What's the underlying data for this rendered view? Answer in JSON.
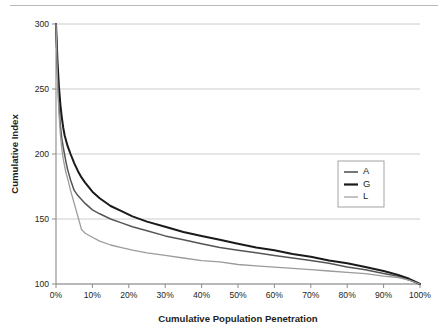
{
  "figure": {
    "has_top_rule": true
  },
  "chart_data": {
    "type": "line",
    "title": "",
    "xlabel": "Cumulative Population Penetration",
    "ylabel": "Cumulative Index",
    "xlim": [
      0,
      100
    ],
    "ylim": [
      100,
      300
    ],
    "grid": true,
    "grid_axis": "y",
    "legend_position": "right-middle",
    "x_ticks": [
      0,
      10,
      20,
      30,
      40,
      50,
      60,
      70,
      80,
      90,
      100
    ],
    "x_tick_labels": [
      "0%",
      "10%",
      "20%",
      "30%",
      "40%",
      "50%",
      "60%",
      "70%",
      "80%",
      "90%",
      "100%"
    ],
    "y_ticks": [
      100,
      150,
      200,
      250,
      300
    ],
    "y_tick_labels": [
      "100",
      "150",
      "200",
      "250",
      "300"
    ],
    "x": [
      0,
      0.4,
      0.8,
      1.2,
      1.6,
      2,
      2.4,
      2.8,
      3.2,
      4,
      5,
      6,
      7,
      8,
      10,
      12,
      15,
      18,
      21,
      25,
      30,
      35,
      40,
      45,
      50,
      55,
      60,
      65,
      70,
      75,
      80,
      85,
      90,
      94,
      97,
      100
    ],
    "series": [
      {
        "name": "A",
        "color": "#555555",
        "width": 1.5,
        "values": [
          300,
          262,
          238,
          222,
          212,
          205,
          199,
          193,
          188,
          180,
          172,
          168,
          165,
          162,
          157,
          154,
          150,
          147,
          144,
          141,
          137,
          134,
          131,
          128,
          126,
          124,
          122,
          120,
          118,
          116,
          113,
          111,
          108,
          106,
          103,
          100
        ]
      },
      {
        "name": "G",
        "color": "#1a1a1a",
        "width": 2.0,
        "values": [
          300,
          272,
          252,
          238,
          228,
          220,
          214,
          210,
          206,
          200,
          193,
          187,
          182,
          178,
          171,
          166,
          160,
          156,
          152,
          148,
          144,
          140,
          137,
          134,
          131,
          128,
          126,
          123,
          121,
          118,
          116,
          113,
          110,
          107,
          104,
          100
        ]
      },
      {
        "name": "L",
        "color": "#9b9b9b",
        "width": 1.3,
        "values": [
          300,
          258,
          232,
          215,
          204,
          196,
          190,
          185,
          181,
          172,
          162,
          152,
          142,
          139,
          136,
          133,
          130,
          128,
          126,
          124,
          122,
          120,
          118,
          117,
          115,
          114,
          113,
          112,
          111,
          110,
          109,
          108,
          106,
          105,
          103,
          100
        ]
      }
    ],
    "legend_entries": [
      {
        "label": "A",
        "color": "#555555",
        "width": 1.6
      },
      {
        "label": "G",
        "color": "#1a1a1a",
        "width": 2.2
      },
      {
        "label": "L",
        "color": "#9b9b9b",
        "width": 1.2
      }
    ]
  }
}
